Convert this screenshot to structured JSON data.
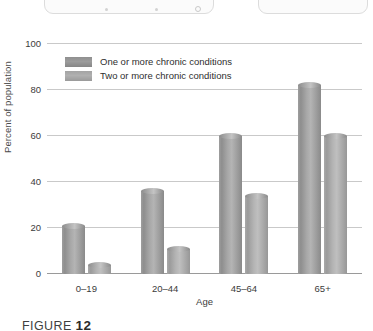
{
  "chrome": {
    "left_pill_name": "toolbar-pill",
    "right_pill_name": "secondary-pill"
  },
  "legend": {
    "items": [
      {
        "label": "One or more chronic conditions",
        "swatch": "dark"
      },
      {
        "label": "Two or more chronic conditions",
        "swatch": "light"
      }
    ]
  },
  "caption": {
    "prefix": "FIGURE ",
    "number": "12"
  },
  "chart_data": {
    "type": "bar",
    "title": "",
    "xlabel": "Age",
    "ylabel": "Percent of population",
    "categories": [
      "0–19",
      "20–44",
      "45–64",
      "65+"
    ],
    "ylim": [
      0,
      100
    ],
    "yticks": [
      0,
      20,
      40,
      60,
      80,
      100
    ],
    "grid": true,
    "legend_position": "top-left-inside",
    "series": [
      {
        "name": "One or more chronic conditions",
        "values": [
          21,
          36,
          60,
          82
        ],
        "color": "#9c9c9c"
      },
      {
        "name": "Two or more chronic conditions",
        "values": [
          4,
          11,
          34,
          60
        ],
        "color": "#b0b0b0"
      }
    ]
  }
}
